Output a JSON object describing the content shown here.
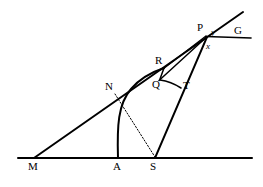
{
  "figure": {
    "type": "geometry-diagram",
    "width": 263,
    "height": 187,
    "stroke_color": "#000000",
    "background_color": "#ffffff"
  },
  "points": [
    {
      "id": "M",
      "label": "M",
      "x": 34,
      "y": 158,
      "label_x": 30,
      "label_y": 162
    },
    {
      "id": "A",
      "label": "A",
      "x": 118,
      "y": 158,
      "label_x": 114,
      "label_y": 162
    },
    {
      "id": "S",
      "label": "S",
      "x": 155,
      "y": 158,
      "label_x": 151,
      "label_y": 162
    },
    {
      "id": "N",
      "label": "N",
      "x": 114,
      "y": 93,
      "label_x": 107,
      "label_y": 84
    },
    {
      "id": "Q",
      "label": "Q",
      "x": 160,
      "y": 79,
      "label_x": 154,
      "label_y": 82
    },
    {
      "id": "R",
      "label": "R",
      "x": 164,
      "y": 68,
      "label_x": 156,
      "label_y": 58
    },
    {
      "id": "T",
      "label": "T",
      "x": 181,
      "y": 88,
      "label_x": 184,
      "label_y": 82
    },
    {
      "id": "P",
      "label": "P",
      "x": 206,
      "y": 36,
      "label_x": 199,
      "label_y": 25
    },
    {
      "id": "G",
      "label": "G",
      "x": 251,
      "y": 38,
      "label_x": 236,
      "label_y": 28
    }
  ],
  "angle_labels": [
    {
      "id": "y",
      "label": "y",
      "x": 212,
      "y": 32
    },
    {
      "id": "x",
      "label": "x",
      "x": 207,
      "y": 45
    }
  ],
  "segments": [
    {
      "id": "baseline-MG",
      "name": "baseline",
      "from": [
        18,
        158
      ],
      "to": [
        252,
        158
      ],
      "style": "solid",
      "width": 2.0
    },
    {
      "id": "ray-MP-extended",
      "name": "ray-M-through-P",
      "from": [
        34,
        158
      ],
      "to": [
        243,
        12
      ],
      "style": "solid",
      "width": 2.0
    },
    {
      "id": "segment-PG",
      "name": "segment-P-to-G",
      "from": [
        206,
        36
      ],
      "to": [
        251,
        38
      ],
      "style": "solid",
      "width": 1.6
    },
    {
      "id": "segment-SP",
      "name": "segment-S-to-P",
      "from": [
        155,
        158
      ],
      "to": [
        207,
        37
      ],
      "style": "solid",
      "width": 1.8
    },
    {
      "id": "segment-QP",
      "name": "segment-Q-to-P",
      "from": [
        159,
        80
      ],
      "to": [
        206,
        37
      ],
      "style": "solid",
      "width": 1.5
    },
    {
      "id": "segment-RP",
      "name": "segment-R-to-P",
      "from": [
        163,
        69
      ],
      "to": [
        206,
        36
      ],
      "style": "solid",
      "width": 1.5
    },
    {
      "id": "segment-QT",
      "name": "segment-Q-to-T",
      "from": [
        160,
        80
      ],
      "to": [
        181,
        88
      ],
      "style": "solid",
      "width": 1.5
    },
    {
      "id": "segment-QR",
      "name": "segment-Q-to-R",
      "from": [
        160,
        79
      ],
      "to": [
        164,
        68
      ],
      "style": "solid",
      "width": 1.5
    },
    {
      "id": "dotted-N-to-S",
      "name": "dotted-line-N-to-S",
      "from": [
        115,
        94
      ],
      "to": [
        155,
        157
      ],
      "style": "dotted",
      "width": 1.0
    }
  ],
  "arcs": [
    {
      "id": "arc-A-to-R",
      "name": "arc-from-A-through-Q-to-R",
      "from": [
        118,
        158
      ],
      "control": [
        122,
        95
      ],
      "to": [
        164,
        68
      ],
      "style": "solid",
      "width": 2.0
    },
    {
      "id": "arc-Q-T-curve",
      "name": "curve-Q-to-T",
      "from": [
        160,
        80
      ],
      "control": [
        171,
        82
      ],
      "to": [
        181,
        88
      ],
      "style": "solid",
      "width": 1.5
    }
  ]
}
